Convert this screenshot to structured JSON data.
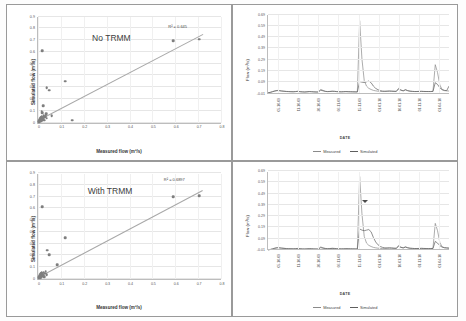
{
  "figure": {
    "layout": "2x2 grid",
    "background": "#ffffff",
    "border_color": "#9a9a9a"
  },
  "panels": {
    "top_left": {
      "name": "scatter-no-trmm",
      "title": "No TRMM",
      "r2_label": "R² = 0.645",
      "xlabel": "Measured flow (m³/s)",
      "ylabel": "Simulated flow (m³/s)"
    },
    "bottom_left": {
      "name": "scatter-with-trmm",
      "title": "With TRMM",
      "r2_label": "R² = 0.6897",
      "xlabel": "Measured flow (m³/s)",
      "ylabel": "Simulated flow (m³/s)"
    },
    "top_right": {
      "name": "timeseries-no-trmm",
      "xlabel": "DATE",
      "ylabel": "Flow (m³/s)",
      "legend": [
        "Measured",
        "Simulated"
      ]
    },
    "bottom_right": {
      "name": "timeseries-with-trmm",
      "xlabel": "DATE",
      "ylabel": "Flow (m³/s)",
      "legend": [
        "Measured",
        "Simulated"
      ],
      "annotation": "arrow-marker"
    }
  },
  "chart_data": [
    {
      "type": "scatter",
      "id": "no-trmm",
      "title": "No TRMM",
      "xlabel": "Measured flow (m³/s)",
      "ylabel": "Simulated flow (m³/s)",
      "xlim": [
        0,
        0.8
      ],
      "ylim": [
        0,
        0.9
      ],
      "xticks": [
        0,
        0.1,
        0.2,
        0.3,
        0.4,
        0.5,
        0.6,
        0.7,
        0.8
      ],
      "yticks": [
        0,
        0.1,
        0.2,
        0.3,
        0.4,
        0.5,
        0.6,
        0.7,
        0.8,
        0.9
      ],
      "grid": "horizontal",
      "annotation": "R² = 0.645",
      "r2": 0.645,
      "trendline": {
        "x": [
          0.0,
          0.72
        ],
        "y": [
          0.015,
          0.745
        ]
      },
      "points": [
        {
          "x": 0.003,
          "y": 0.005
        },
        {
          "x": 0.004,
          "y": 0.012
        },
        {
          "x": 0.005,
          "y": 0.018
        },
        {
          "x": 0.006,
          "y": 0.008
        },
        {
          "x": 0.007,
          "y": 0.026
        },
        {
          "x": 0.008,
          "y": 0.014
        },
        {
          "x": 0.009,
          "y": 0.032
        },
        {
          "x": 0.01,
          "y": 0.02
        },
        {
          "x": 0.011,
          "y": 0.04
        },
        {
          "x": 0.012,
          "y": 0.01
        },
        {
          "x": 0.013,
          "y": 0.028
        },
        {
          "x": 0.014,
          "y": 0.046
        },
        {
          "x": 0.015,
          "y": 0.016
        },
        {
          "x": 0.016,
          "y": 0.034
        },
        {
          "x": 0.017,
          "y": 0.052
        },
        {
          "x": 0.018,
          "y": 0.022
        },
        {
          "x": 0.019,
          "y": 0.038
        },
        {
          "x": 0.021,
          "y": 0.044
        },
        {
          "x": 0.023,
          "y": 0.03
        },
        {
          "x": 0.025,
          "y": 0.055
        },
        {
          "x": 0.028,
          "y": 0.018
        },
        {
          "x": 0.031,
          "y": 0.048
        },
        {
          "x": 0.034,
          "y": 0.062
        },
        {
          "x": 0.038,
          "y": 0.035
        },
        {
          "x": 0.016,
          "y": 0.095
        },
        {
          "x": 0.019,
          "y": 0.085
        },
        {
          "x": 0.022,
          "y": 0.14
        },
        {
          "x": 0.018,
          "y": 0.61
        },
        {
          "x": 0.038,
          "y": 0.295
        },
        {
          "x": 0.048,
          "y": 0.275
        },
        {
          "x": 0.035,
          "y": 0.075
        },
        {
          "x": 0.06,
          "y": 0.058
        },
        {
          "x": 0.118,
          "y": 0.35
        },
        {
          "x": 0.15,
          "y": 0.02
        },
        {
          "x": 0.59,
          "y": 0.695
        },
        {
          "x": 0.705,
          "y": 0.705
        }
      ]
    },
    {
      "type": "scatter",
      "id": "with-trmm",
      "title": "With TRMM",
      "xlabel": "Measured flow (m³/s)",
      "ylabel": "Simulated flow (m³/s)",
      "xlim": [
        0,
        0.8
      ],
      "ylim": [
        0,
        0.9
      ],
      "xticks": [
        0,
        0.1,
        0.2,
        0.3,
        0.4,
        0.5,
        0.6,
        0.7,
        0.8
      ],
      "yticks": [
        0,
        0.1,
        0.2,
        0.3,
        0.4,
        0.5,
        0.6,
        0.7,
        0.8,
        0.9
      ],
      "grid": "horizontal",
      "annotation": "R² = 0.6897",
      "r2": 0.6897,
      "trendline": {
        "x": [
          0.0,
          0.72
        ],
        "y": [
          0.01,
          0.75
        ]
      },
      "points": [
        {
          "x": 0.003,
          "y": 0.006
        },
        {
          "x": 0.004,
          "y": 0.014
        },
        {
          "x": 0.005,
          "y": 0.02
        },
        {
          "x": 0.006,
          "y": 0.01
        },
        {
          "x": 0.007,
          "y": 0.028
        },
        {
          "x": 0.008,
          "y": 0.016
        },
        {
          "x": 0.009,
          "y": 0.034
        },
        {
          "x": 0.01,
          "y": 0.022
        },
        {
          "x": 0.011,
          "y": 0.042
        },
        {
          "x": 0.012,
          "y": 0.012
        },
        {
          "x": 0.013,
          "y": 0.03
        },
        {
          "x": 0.014,
          "y": 0.048
        },
        {
          "x": 0.015,
          "y": 0.018
        },
        {
          "x": 0.016,
          "y": 0.036
        },
        {
          "x": 0.017,
          "y": 0.054
        },
        {
          "x": 0.018,
          "y": 0.024
        },
        {
          "x": 0.019,
          "y": 0.04
        },
        {
          "x": 0.021,
          "y": 0.046
        },
        {
          "x": 0.023,
          "y": 0.032
        },
        {
          "x": 0.025,
          "y": 0.058
        },
        {
          "x": 0.028,
          "y": 0.02
        },
        {
          "x": 0.031,
          "y": 0.05
        },
        {
          "x": 0.034,
          "y": 0.064
        },
        {
          "x": 0.038,
          "y": 0.038
        },
        {
          "x": 0.019,
          "y": 0.615
        },
        {
          "x": 0.04,
          "y": 0.245
        },
        {
          "x": 0.05,
          "y": 0.205
        },
        {
          "x": 0.085,
          "y": 0.12
        },
        {
          "x": 0.118,
          "y": 0.35
        },
        {
          "x": 0.59,
          "y": 0.7
        },
        {
          "x": 0.705,
          "y": 0.705
        }
      ]
    },
    {
      "type": "line",
      "id": "ts-no-trmm",
      "xlabel": "DATE",
      "ylabel": "Flow (m³/s)",
      "ylim": [
        -0.01,
        0.69
      ],
      "yticks": [
        -0.01,
        0.09,
        0.19,
        0.29,
        0.39,
        0.49,
        0.59,
        0.69
      ],
      "xtick_labels": [
        "05-10-09",
        "11-10-09",
        "20-10-09",
        "06-11-09",
        "15-11-09",
        "01-01-10",
        "10-01-10",
        "01-11-10",
        "01-04-10"
      ],
      "legend": [
        "Measured",
        "Simulated"
      ],
      "legend_position": "bottom",
      "grid": "horizontal",
      "series": [
        {
          "name": "Measured",
          "color": "#8a8a8a",
          "values": [
            0.0,
            0.005,
            0.012,
            0.018,
            0.022,
            0.02,
            0.017,
            0.015,
            0.013,
            0.012,
            0.011,
            0.01,
            0.012,
            0.014,
            0.011,
            0.009,
            0.008,
            0.01,
            0.012,
            0.011,
            0.009,
            0.008,
            0.008,
            0.03,
            0.022,
            0.014,
            0.012,
            0.013,
            0.015,
            0.014,
            0.012,
            0.01,
            0.01,
            0.011,
            0.012,
            0.011,
            0.01,
            0.01,
            0.009,
            0.009,
            0.64,
            0.3,
            0.11,
            0.06,
            0.04,
            0.03,
            0.022,
            0.018,
            0.015,
            0.013,
            0.012,
            0.012,
            0.013,
            0.014,
            0.013,
            0.012,
            0.012,
            0.04,
            0.025,
            0.018,
            0.03,
            0.02,
            0.015,
            0.013,
            0.012,
            0.012,
            0.013,
            0.014,
            0.013,
            0.012,
            0.012,
            0.012,
            0.013,
            0.25,
            0.18,
            0.07,
            0.03,
            0.02,
            0.018,
            0.016
          ]
        },
        {
          "name": "Simulated",
          "color": "#5e5e5e",
          "values": [
            0.0,
            0.004,
            0.01,
            0.016,
            0.02,
            0.019,
            0.016,
            0.014,
            0.012,
            0.011,
            0.01,
            0.01,
            0.011,
            0.013,
            0.01,
            0.009,
            0.008,
            0.009,
            0.011,
            0.01,
            0.009,
            0.008,
            0.008,
            0.024,
            0.018,
            0.013,
            0.011,
            0.012,
            0.014,
            0.013,
            0.011,
            0.01,
            0.009,
            0.01,
            0.011,
            0.01,
            0.01,
            0.009,
            0.009,
            0.008,
            0.1,
            0.095,
            0.092,
            0.098,
            0.105,
            0.09,
            0.06,
            0.04,
            0.028,
            0.02,
            0.016,
            0.015,
            0.016,
            0.017,
            0.016,
            0.015,
            0.014,
            0.035,
            0.024,
            0.018,
            0.026,
            0.019,
            0.015,
            0.013,
            0.012,
            0.012,
            0.013,
            0.013,
            0.012,
            0.012,
            0.012,
            0.012,
            0.013,
            0.09,
            0.075,
            0.045,
            0.028,
            0.022,
            0.02,
            0.06
          ]
        }
      ]
    },
    {
      "type": "line",
      "id": "ts-with-trmm",
      "xlabel": "DATE",
      "ylabel": "Flow (m³/s)",
      "ylim": [
        -0.01,
        0.69
      ],
      "yticks": [
        -0.01,
        0.09,
        0.19,
        0.29,
        0.39,
        0.49,
        0.59,
        0.69
      ],
      "xtick_labels": [
        "05-10-09",
        "11-10-09",
        "20-10-09",
        "06-11-09",
        "15-11-09",
        "01-01-10",
        "10-01-10",
        "01-11-10",
        "01-04-10"
      ],
      "legend": [
        "Measured",
        "Simulated"
      ],
      "legend_position": "bottom",
      "grid": "horizontal",
      "annotation": "arrow-marker",
      "series": [
        {
          "name": "Measured",
          "color": "#8a8a8a",
          "values": [
            0.0,
            0.004,
            0.01,
            0.016,
            0.02,
            0.019,
            0.016,
            0.014,
            0.012,
            0.011,
            0.01,
            0.01,
            0.011,
            0.013,
            0.01,
            0.009,
            0.008,
            0.009,
            0.011,
            0.01,
            0.009,
            0.008,
            0.008,
            0.026,
            0.018,
            0.013,
            0.011,
            0.012,
            0.014,
            0.013,
            0.011,
            0.01,
            0.009,
            0.01,
            0.011,
            0.01,
            0.01,
            0.009,
            0.009,
            0.008,
            0.65,
            0.32,
            0.12,
            0.06,
            0.04,
            0.03,
            0.022,
            0.018,
            0.015,
            0.013,
            0.012,
            0.012,
            0.013,
            0.014,
            0.013,
            0.012,
            0.012,
            0.038,
            0.024,
            0.018,
            0.028,
            0.019,
            0.015,
            0.013,
            0.012,
            0.012,
            0.013,
            0.014,
            0.013,
            0.012,
            0.012,
            0.012,
            0.013,
            0.235,
            0.17,
            0.065,
            0.028,
            0.018,
            0.016,
            0.014
          ]
        },
        {
          "name": "Simulated",
          "color": "#5e5e5e",
          "values": [
            0.0,
            0.003,
            0.008,
            0.014,
            0.018,
            0.017,
            0.015,
            0.013,
            0.011,
            0.01,
            0.01,
            0.009,
            0.01,
            0.012,
            0.01,
            0.008,
            0.008,
            0.009,
            0.01,
            0.01,
            0.008,
            0.008,
            0.007,
            0.02,
            0.015,
            0.012,
            0.01,
            0.011,
            0.013,
            0.012,
            0.01,
            0.009,
            0.009,
            0.009,
            0.01,
            0.01,
            0.009,
            0.009,
            0.008,
            0.008,
            0.185,
            0.175,
            0.17,
            0.175,
            0.18,
            0.16,
            0.11,
            0.07,
            0.045,
            0.03,
            0.022,
            0.018,
            0.018,
            0.019,
            0.018,
            0.016,
            0.015,
            0.032,
            0.022,
            0.017,
            0.024,
            0.018,
            0.014,
            0.013,
            0.012,
            0.012,
            0.012,
            0.013,
            0.012,
            0.012,
            0.011,
            0.012,
            0.012,
            0.075,
            0.06,
            0.038,
            0.024,
            0.02,
            0.018,
            0.016
          ]
        }
      ]
    }
  ]
}
